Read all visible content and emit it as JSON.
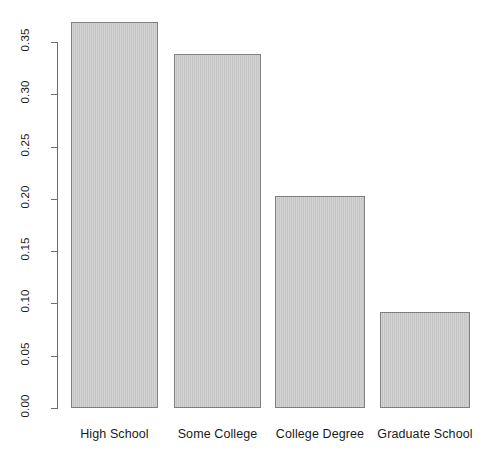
{
  "chart_data": {
    "type": "bar",
    "title": "",
    "subtitle": "",
    "xlabel": "",
    "ylabel": "",
    "categories": [
      "High School",
      "Some College",
      "College Degree",
      "Graduate School"
    ],
    "values": [
      0.369,
      0.339,
      0.203,
      0.092
    ],
    "series": [
      {
        "name": "Proportion",
        "values": [
          0.369,
          0.339,
          0.203,
          0.092
        ]
      }
    ],
    "ylim": [
      0.0,
      0.37
    ],
    "xlim": [
      0,
      4
    ],
    "y_ticks": [
      0.0,
      0.05,
      0.1,
      0.15,
      0.2,
      0.25,
      0.3,
      0.35
    ],
    "y_tick_labels": [
      "0.00",
      "0.05",
      "0.10",
      "0.15",
      "0.20",
      "0.25",
      "0.30",
      "0.35"
    ],
    "y_tick_label_rotation": -90,
    "grid": false,
    "legend": false,
    "legend_position": "none",
    "bar_fill_color": "#c8c8c8",
    "bar_border_color": "#808080",
    "axis_color": "#6e6e6e",
    "background_color": "#ffffff",
    "annotations": []
  },
  "axis": {
    "y_labels": [
      {
        "text": "0.35",
        "value": 0.35
      },
      {
        "text": "0.30",
        "value": 0.3
      },
      {
        "text": "0.25",
        "value": 0.25
      },
      {
        "text": "0.20",
        "value": 0.2
      },
      {
        "text": "0.15",
        "value": 0.15
      },
      {
        "text": "0.10",
        "value": 0.1
      },
      {
        "text": "0.05",
        "value": 0.05
      },
      {
        "text": "0.00",
        "value": 0.0
      }
    ]
  },
  "bars": [
    {
      "label": "High School",
      "value": 0.369
    },
    {
      "label": "Some College",
      "value": 0.339
    },
    {
      "label": "College Degree",
      "value": 0.203
    },
    {
      "label": "Graduate School",
      "value": 0.092
    }
  ]
}
